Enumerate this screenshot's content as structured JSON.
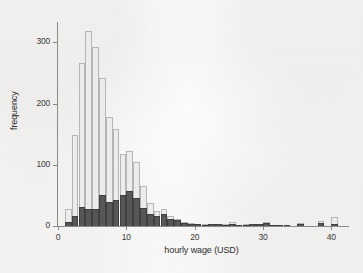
{
  "figure": {
    "kind": "histogram-figure",
    "background_color": "#fdfdfc"
  },
  "axes": {
    "xlabel": "hourly wage (USD)",
    "ylabel": "frequency",
    "x_ticks": [
      "0",
      "10",
      "20",
      "30",
      "40"
    ],
    "y_ticks": [
      "0",
      "100",
      "200",
      "300"
    ]
  },
  "chart_data": {
    "type": "bar",
    "title": "",
    "subtitle": "",
    "xlabel": "hourly wage (USD)",
    "ylabel": "frequency",
    "xlim": [
      0,
      42
    ],
    "ylim": [
      0,
      330
    ],
    "xticks": [
      0,
      10,
      20,
      30,
      40
    ],
    "yticks": [
      0,
      100,
      200,
      300
    ],
    "grid": false,
    "legend": "none",
    "bin_width": 1,
    "bar_style": {
      "total_fill": "#ececea",
      "total_edge": "#b6b6b4",
      "subgroup_fill": "#575757",
      "subgroup_edge": "#3f3f3f"
    },
    "x": [
      1.5,
      2.5,
      3.5,
      4.5,
      5.5,
      6.5,
      7.5,
      8.5,
      9.5,
      10.5,
      11.5,
      12.5,
      13.5,
      14.5,
      15.5,
      16.5,
      17.5,
      18.5,
      19.5,
      20.5,
      21.5,
      22.5,
      23.5,
      24.5,
      25.5,
      26.5,
      27.5,
      28.5,
      29.5,
      30.5,
      31.5,
      32.5,
      33.5,
      35.5,
      38.5,
      40.5
    ],
    "series": [
      {
        "name": "total frequency",
        "values": [
          27,
          148,
          266,
          319,
          293,
          242,
          178,
          158,
          118,
          122,
          104,
          66,
          38,
          24,
          28,
          16,
          11,
          7,
          5,
          4,
          3,
          4,
          4,
          3,
          7,
          2,
          3,
          4,
          4,
          6,
          2,
          2,
          1,
          5,
          9,
          14
        ]
      },
      {
        "name": "subgroup frequency",
        "values": [
          6,
          16,
          31,
          27,
          28,
          51,
          39,
          43,
          51,
          58,
          45,
          29,
          20,
          17,
          19,
          12,
          10,
          5,
          4,
          3,
          2,
          3,
          3,
          2,
          4,
          1,
          2,
          3,
          3,
          5,
          1,
          1,
          1,
          4,
          5,
          4
        ]
      }
    ]
  }
}
